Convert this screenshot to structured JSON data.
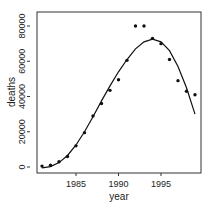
{
  "chart_data": {
    "type": "scatter",
    "title": "",
    "xlabel": "year",
    "ylabel": "deaths",
    "xlim": [
      1980.5,
      1999.8
    ],
    "ylim": [
      -3000,
      84000
    ],
    "xticks": [
      1985,
      1990,
      1995
    ],
    "xtick_labels": [
      "1985",
      "1990",
      "1995"
    ],
    "yticks": [
      0,
      20000,
      40000,
      60000,
      80000
    ],
    "ytick_labels": [
      "0",
      "20000",
      "40000",
      "60000",
      "80000"
    ],
    "grid": false,
    "legend": null,
    "series": [
      {
        "name": "observed",
        "style": "points",
        "x": [
          1981,
          1982,
          1983,
          1984,
          1985,
          1986,
          1987,
          1988,
          1989,
          1990,
          1991,
          1992,
          1993,
          1994,
          1995,
          1996,
          1997,
          1998,
          1999
        ],
        "y": [
          500,
          1000,
          3000,
          6000,
          12000,
          19500,
          29000,
          36000,
          43500,
          49500,
          60500,
          80000,
          80000,
          73000,
          70000,
          61000,
          49000,
          43000,
          41000
        ]
      },
      {
        "name": "fitted curve",
        "style": "line",
        "x": [
          1981,
          1982,
          1983,
          1984,
          1985,
          1986,
          1987,
          1988,
          1989,
          1990,
          1991,
          1992,
          1993,
          1994,
          1995,
          1996,
          1997,
          1998,
          1999
        ],
        "y": [
          -500,
          200,
          2500,
          6500,
          12500,
          20000,
          28500,
          37500,
          46000,
          54000,
          61000,
          67000,
          71000,
          72500,
          71000,
          66000,
          57000,
          45000,
          30000
        ]
      }
    ]
  }
}
